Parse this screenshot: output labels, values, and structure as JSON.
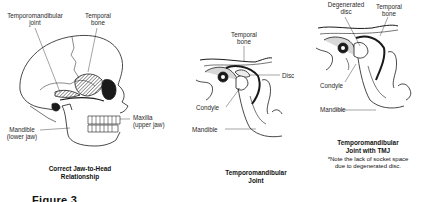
{
  "panels": [
    {
      "id": "skull",
      "caption": [
        "Correct Jaw-to-Head",
        "Relationship"
      ],
      "labels": {
        "tmj": [
          "Temporomandibular",
          "joint"
        ],
        "temporal_bone": [
          "Temporal",
          "bone"
        ],
        "mandible": [
          "Mandible",
          "(lower jaw)"
        ],
        "maxilla": [
          "Maxilla",
          "(upper jaw)"
        ]
      }
    },
    {
      "id": "tmj-normal",
      "caption": [
        "Temporomandibular",
        "Joint"
      ],
      "labels": {
        "temporal_bone": [
          "Temporal",
          "bone"
        ],
        "disc": "Disc",
        "condyle": "Condyle",
        "mandible": "Mandible"
      }
    },
    {
      "id": "tmj-degenerated",
      "caption": [
        "Temporomandibular",
        "Joint with TMJ"
      ],
      "note": [
        "*Note the lack of socket space",
        "due to degenerated disc."
      ],
      "labels": {
        "degenerated_disc": [
          "Degenerated",
          "disc"
        ],
        "temporal_bone": [
          "Temporal",
          "bone"
        ],
        "condyle": "Condyle",
        "mandible": "Mandible"
      }
    }
  ],
  "figure_label": "Figure 3"
}
